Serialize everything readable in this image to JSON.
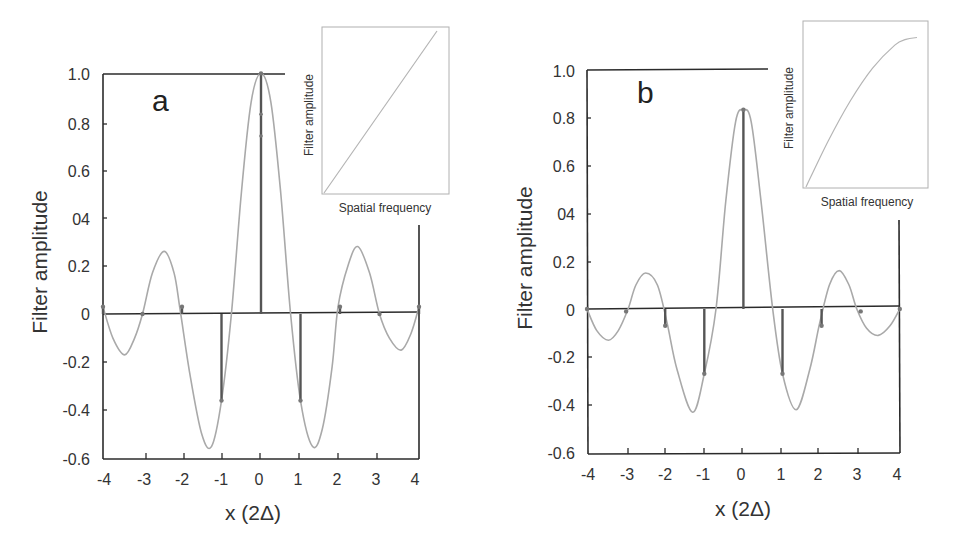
{
  "figure": {
    "panels": [
      {
        "letter": "a",
        "ylabel": "Filter amplitude",
        "xlabel": "x (2Δ)",
        "yticks": [
          "1.0",
          "0.8",
          "0.6",
          "04",
          "0.2",
          "0",
          "-0.2",
          "-0.4",
          "-0.6"
        ],
        "xticks": [
          "-4",
          "-3",
          "-2",
          "-1",
          "0",
          "1",
          "2",
          "3",
          "4"
        ],
        "inset": {
          "ylabel": "Filter amplitude",
          "xlabel": "Spatial frequency"
        }
      },
      {
        "letter": "b",
        "ylabel": "Filter amplitude",
        "xlabel": "x (2Δ)",
        "yticks": [
          "1.0",
          "0.8",
          "0.6",
          "04",
          "0.2",
          "0",
          "-0.2",
          "-0.4",
          "-0.6"
        ],
        "xticks": [
          "-4",
          "-3",
          "-2",
          "-1",
          "0",
          "1",
          "2",
          "3",
          "4"
        ],
        "inset": {
          "ylabel": "Filter amplitude",
          "xlabel": "Spatial frequency"
        }
      }
    ],
    "colors": {
      "axis": "#2b2b2b",
      "curve": "#a9a9a9",
      "stem": "#555555",
      "inset_curve": "#b5b5b5"
    }
  },
  "chart_data": [
    {
      "type": "line",
      "title": "a",
      "xlabel": "x (2Δ)",
      "ylabel": "Filter amplitude",
      "xlim": [
        -4,
        4
      ],
      "ylim": [
        -0.6,
        1.0
      ],
      "xticks": [
        -4,
        -3,
        -2,
        -1,
        0,
        1,
        2,
        3,
        4
      ],
      "yticks": [
        1.0,
        0.8,
        0.6,
        0.4,
        0.2,
        0,
        -0.2,
        -0.4,
        -0.6
      ],
      "ytick_labels": [
        "1.0",
        "0.8",
        "0.6",
        "04",
        "0.2",
        "0",
        "-0.2",
        "-0.4",
        "-0.6"
      ],
      "grid": false,
      "series": [
        {
          "name": "continuous filter",
          "kind": "curve",
          "x": [
            -4.0,
            -3.75,
            -3.45,
            -3.2,
            -3.0,
            -2.75,
            -2.45,
            -2.2,
            -2.05,
            -1.8,
            -1.5,
            -1.25,
            -1.0,
            -0.75,
            -0.5,
            -0.25,
            0.0,
            0.25,
            0.5,
            0.75,
            1.0,
            1.3,
            1.55,
            1.8,
            1.95,
            2.2,
            2.45,
            2.75,
            3.0,
            3.25,
            3.55,
            3.8,
            4.0
          ],
          "y": [
            0.03,
            -0.1,
            -0.17,
            -0.1,
            0.0,
            0.17,
            0.26,
            0.17,
            0.02,
            -0.25,
            -0.5,
            -0.55,
            -0.36,
            0.0,
            0.5,
            0.88,
            1.0,
            0.88,
            0.5,
            0.0,
            -0.36,
            -0.55,
            -0.48,
            -0.22,
            0.03,
            0.2,
            0.28,
            0.17,
            0.0,
            -0.1,
            -0.15,
            -0.08,
            0.03
          ]
        },
        {
          "name": "sampled weights",
          "kind": "stem",
          "x": [
            -4,
            -3,
            -2,
            -1,
            0,
            1,
            2,
            3,
            4
          ],
          "y": [
            0.03,
            0.0,
            0.03,
            -0.36,
            1.0,
            -0.36,
            0.03,
            0.0,
            0.03
          ]
        }
      ],
      "annotations": [
        {
          "x": 0,
          "y": 0.83
        },
        {
          "x": 0,
          "y": 0.74
        }
      ],
      "inset": {
        "type": "line",
        "xlabel": "Spatial frequency",
        "ylabel": "Filter amplitude",
        "x": [
          0,
          1
        ],
        "y": [
          0,
          1
        ],
        "shape": "linear ramp"
      }
    },
    {
      "type": "line",
      "title": "b",
      "xlabel": "x (2Δ)",
      "ylabel": "Filter amplitude",
      "xlim": [
        -4,
        4
      ],
      "ylim": [
        -0.6,
        1.0
      ],
      "xticks": [
        -4,
        -3,
        -2,
        -1,
        0,
        1,
        2,
        3,
        4
      ],
      "yticks": [
        1.0,
        0.8,
        0.6,
        0.4,
        0.2,
        0,
        -0.2,
        -0.4,
        -0.6
      ],
      "ytick_labels": [
        "1.0",
        "0.8",
        "0.6",
        "04",
        "0.2",
        "0",
        "-0.2",
        "-0.4",
        "-0.6"
      ],
      "grid": false,
      "series": [
        {
          "name": "continuous filter",
          "kind": "curve",
          "x": [
            -4.0,
            -3.75,
            -3.45,
            -3.2,
            -2.95,
            -2.75,
            -2.5,
            -2.2,
            -1.95,
            -1.7,
            -1.3,
            -1.0,
            -0.7,
            -0.45,
            -0.2,
            0.0,
            0.2,
            0.45,
            0.75,
            1.0,
            1.35,
            1.7,
            1.95,
            2.2,
            2.45,
            2.7,
            2.9,
            3.15,
            3.45,
            3.75,
            4.0
          ],
          "y": [
            0.0,
            -0.09,
            -0.13,
            -0.09,
            0.0,
            0.1,
            0.15,
            0.1,
            -0.06,
            -0.25,
            -0.43,
            -0.27,
            0.0,
            0.45,
            0.78,
            0.83,
            0.78,
            0.45,
            0.0,
            -0.27,
            -0.42,
            -0.25,
            -0.06,
            0.1,
            0.16,
            0.1,
            0.0,
            -0.08,
            -0.11,
            -0.07,
            0.0
          ]
        },
        {
          "name": "sampled weights",
          "kind": "stem",
          "x": [
            -4,
            -3,
            -2,
            -1,
            0,
            1,
            2,
            3,
            4
          ],
          "y": [
            0.0,
            -0.01,
            -0.07,
            -0.27,
            0.83,
            -0.27,
            -0.07,
            -0.01,
            0.0
          ]
        }
      ],
      "inset": {
        "type": "line",
        "xlabel": "Spatial frequency",
        "ylabel": "Filter amplitude",
        "x": [
          0,
          0.2,
          0.4,
          0.6,
          0.8,
          0.9,
          1.0
        ],
        "y": [
          0,
          0.24,
          0.45,
          0.62,
          0.74,
          0.77,
          0.78
        ],
        "shape": "saturating curve"
      }
    }
  ]
}
